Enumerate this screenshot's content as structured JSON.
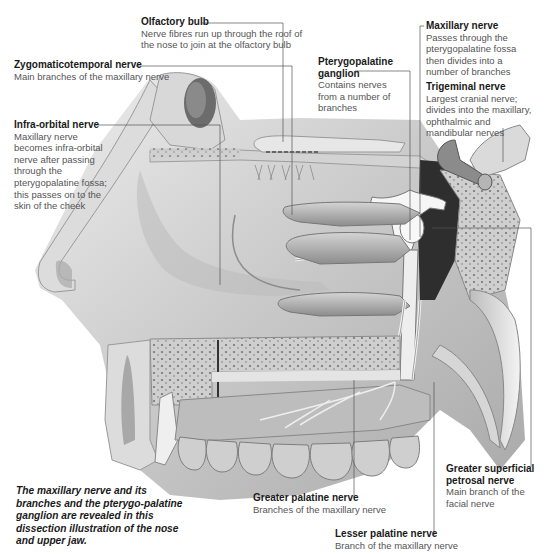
{
  "figure": {
    "caption": "The maxillary nerve and its branches and the pterygo-palatine ganglion are revealed in this dissection illustration of the nose and upper jaw."
  },
  "labels": {
    "olfactory_bulb": {
      "title": "Olfactory bulb",
      "line1": "Nerve fibres run up through the roof of",
      "line2": "the nose to join at the olfactory bulb"
    },
    "zygomaticotemporal": {
      "title": "Zygomaticotemporal nerve",
      "line1": "Main branches of the maxillary nerve"
    },
    "infra_orbital": {
      "title": "Infra-orbital nerve",
      "line1": "Maxillary nerve",
      "line2": "becomes infra-orbital",
      "line3": "nerve after passing",
      "line4": "through the",
      "line5": "pterygopalatine fossa;",
      "line6": "this passes on to the",
      "line7": "skin of the cheek"
    },
    "pterygopalatine_ganglion": {
      "title1": "Pterygopalatine",
      "title2": "ganglion",
      "line1": "Contains nerves",
      "line2": "from a number of",
      "line3": "branches"
    },
    "maxillary_nerve": {
      "title": "Maxillary nerve",
      "line1": "Passes through the",
      "line2": "pterygopalatine fossa",
      "line3": "then divides into a",
      "line4": "number of branches"
    },
    "trigeminal_nerve": {
      "title": "Trigeminal nerve",
      "line1": "Largest cranial nerve;",
      "line2": "divides into the maxillary,",
      "line3": "ophthalmic and",
      "line4": "mandibular nerves"
    },
    "greater_superficial_petrosal": {
      "title1": "Greater superficial",
      "title2": "petrosal nerve",
      "line1": "Main branch of the",
      "line2": "facial nerve"
    },
    "greater_palatine": {
      "title": "Greater palatine nerve",
      "line1": "Branches of the maxillary nerve"
    },
    "lesser_palatine": {
      "title": "Lesser palatine nerve",
      "line1": "Branch of the maxillary nerve"
    }
  },
  "colors": {
    "background": "#ffffff",
    "bone": "#d8d8d8",
    "bone_dark": "#b4b4b4",
    "tissue": "#c8c8c8",
    "nerve": "#f4f4f4",
    "cavity_dark": "#3a3a3a",
    "leader_line": "#555555",
    "title_text": "#1a1a1a",
    "body_text": "#555555"
  }
}
